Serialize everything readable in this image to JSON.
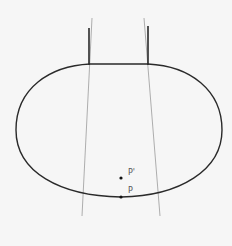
{
  "diagram": {
    "labels": {
      "p_prime": "P'",
      "p": "P"
    },
    "colors": {
      "background": "#f6f6f6",
      "outline": "#2a2a2a",
      "guide_lines": "#9a9a9a",
      "points": "#111111"
    }
  }
}
